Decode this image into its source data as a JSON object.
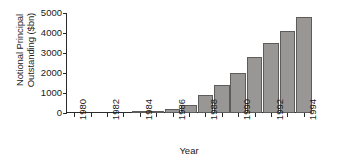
{
  "chart_data": {
    "type": "bar",
    "title": "",
    "xlabel": "Year",
    "ylabel": "Notional Principal\nOutstanding ($bn)",
    "categories": [
      1980,
      1981,
      1982,
      1983,
      1984,
      1985,
      1986,
      1987,
      1988,
      1989,
      1990,
      1991,
      1992,
      1993,
      1994
    ],
    "values": [
      0,
      0,
      0,
      0,
      20,
      60,
      180,
      400,
      900,
      1400,
      2000,
      2800,
      3500,
      4100,
      4800
    ],
    "ylim": [
      0,
      5000
    ],
    "yticks": [
      0,
      1000,
      2000,
      3000,
      4000,
      5000
    ],
    "ytick_labels": [
      "0",
      "1000",
      "2000",
      "3000",
      "4000",
      "5000"
    ],
    "xlim": [
      1979.5,
      1994.5
    ],
    "xticks": [
      1980,
      1981,
      1982,
      1983,
      1984,
      1985,
      1986,
      1987,
      1988,
      1989,
      1990,
      1991,
      1992,
      1993,
      1994
    ],
    "xtick_labels": [
      "1980",
      "",
      "1982",
      "",
      "1984",
      "",
      "1986",
      "",
      "1988",
      "",
      "1990",
      "",
      "1992",
      "",
      "1994"
    ],
    "xtick_label_rotation": 90,
    "grid": false,
    "legend": false,
    "bar_color": "#999795",
    "bar_edge_color": "#5d5c5a",
    "axis_color": "#2b2b2b",
    "background": "#ffffff"
  }
}
